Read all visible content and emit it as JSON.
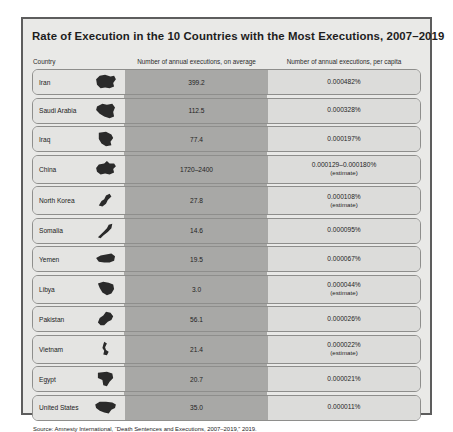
{
  "card": {
    "title": "Rate of Execution in the 10 Countries with the Most Executions, 2007–2019",
    "source": "Source: Amnesty International, “Death Sentences and Executions, 2007–2019,” 2019.",
    "colors": {
      "page_background": "#ffffff",
      "card_background": "#e9e9e7",
      "card_border": "#5d5d5d",
      "country_cell": "#e4e4e2",
      "average_band": "#a8a8a6",
      "per_capita_cell": "#dcdcda",
      "row_border": "#8e8e8c",
      "icon": "#2a2a2a",
      "text": "#1c1c1c"
    }
  },
  "headers": {
    "country": "Country",
    "average": "Number of annual executions, on average",
    "per_capita": "Number of annual executions, per capita"
  },
  "rows": [
    {
      "country": "Iran",
      "icon": "iran-map-icon",
      "average": "399.2",
      "per_capita": "0.000482%",
      "note": ""
    },
    {
      "country": "Saudi Arabia",
      "icon": "saudi-arabia-map-icon",
      "average": "112.5",
      "per_capita": "0.000328%",
      "note": ""
    },
    {
      "country": "Iraq",
      "icon": "iraq-map-icon",
      "average": "77.4",
      "per_capita": "0.000197%",
      "note": ""
    },
    {
      "country": "China",
      "icon": "china-map-icon",
      "average": "1720–2400",
      "per_capita": "0.000129–0.000180%",
      "note": "(estimate)"
    },
    {
      "country": "North Korea",
      "icon": "north-korea-map-icon",
      "average": "27.8",
      "per_capita": "0.000108%",
      "note": "(estimate)"
    },
    {
      "country": "Somalia",
      "icon": "somalia-map-icon",
      "average": "14.6",
      "per_capita": "0.000095%",
      "note": ""
    },
    {
      "country": "Yemen",
      "icon": "yemen-map-icon",
      "average": "19.5",
      "per_capita": "0.000067%",
      "note": ""
    },
    {
      "country": "Libya",
      "icon": "libya-map-icon",
      "average": "3.0",
      "per_capita": "0.000044%",
      "note": "(estimate)"
    },
    {
      "country": "Pakistan",
      "icon": "pakistan-map-icon",
      "average": "56.1",
      "per_capita": "0.000026%",
      "note": ""
    },
    {
      "country": "Vietnam",
      "icon": "vietnam-map-icon",
      "average": "21.4",
      "per_capita": "0.000022%",
      "note": "(estimate)"
    },
    {
      "country": "Egypt",
      "icon": "egypt-map-icon",
      "average": "20.7",
      "per_capita": "0.000021%",
      "note": ""
    },
    {
      "country": "United States",
      "icon": "united-states-map-icon",
      "average": "35.0",
      "per_capita": "0.000011%",
      "note": ""
    }
  ],
  "chart_data": {
    "type": "table",
    "title": "Rate of Execution in the 10 Countries with the Most Executions, 2007–2019",
    "columns": [
      "Country",
      "Number of annual executions, on average",
      "Number of annual executions, per capita"
    ],
    "categories": [
      "Iran",
      "Saudi Arabia",
      "Iraq",
      "China",
      "North Korea",
      "Somalia",
      "Yemen",
      "Libya",
      "Pakistan",
      "Vietnam",
      "Egypt",
      "United States"
    ],
    "series": [
      {
        "name": "Number of annual executions, on average",
        "values": [
          399.2,
          112.5,
          77.4,
          "1720–2400",
          27.8,
          14.6,
          19.5,
          3.0,
          56.1,
          21.4,
          20.7,
          35.0
        ]
      },
      {
        "name": "Number of annual executions, per capita",
        "values": [
          "0.000482%",
          "0.000328%",
          "0.000197%",
          "0.000129–0.000180%",
          "0.000108%",
          "0.000095%",
          "0.000067%",
          "0.000044%",
          "0.000026%",
          "0.000022%",
          "0.000021%",
          "0.000011%"
        ]
      }
    ],
    "annotations": [
      {
        "row": "China",
        "text": "(estimate)"
      },
      {
        "row": "North Korea",
        "text": "(estimate)"
      },
      {
        "row": "Libya",
        "text": "(estimate)"
      },
      {
        "row": "Vietnam",
        "text": "(estimate)"
      }
    ],
    "sorted_by": "Number of annual executions, per capita (descending)",
    "source": "Source: Amnesty International, “Death Sentences and Executions, 2007–2019,” 2019."
  }
}
